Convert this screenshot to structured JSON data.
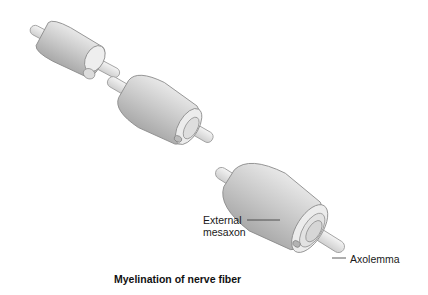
{
  "diagram": {
    "title": "Myelination of nerve fiber",
    "stages": [
      {
        "id": "stage-1",
        "description": "Schwann cell beginning to wrap axon"
      },
      {
        "id": "stage-2",
        "description": "Schwann cell wrapping around axon"
      },
      {
        "id": "stage-3",
        "description": "Myelin sheath layers around axon"
      }
    ],
    "labels": {
      "external_mesaxon_line1": "External",
      "external_mesaxon_line2": "mesaxon",
      "axolemma": "Axolemma"
    },
    "colors": {
      "background": "#ffffff",
      "cell_body": "#c8c8c8",
      "cell_highlight": "#e6e6e6",
      "outline": "#8a8a8a",
      "text": "#1a1a1a"
    }
  }
}
